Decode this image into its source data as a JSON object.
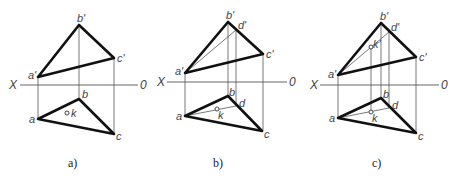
{
  "figure": {
    "axis_labels": {
      "left": "X",
      "right": "0"
    },
    "panels": [
      {
        "id": "a",
        "caption": "a)",
        "labels": {
          "a_top": "a'",
          "b_top": "b'",
          "c_top": "c'",
          "a_bot": "a",
          "b_bot": "b",
          "c_bot": "c",
          "k_bot": "k"
        }
      },
      {
        "id": "b",
        "caption": "b)",
        "labels": {
          "a_top": "a'",
          "b_top": "b'",
          "c_top": "c'",
          "d_top": "d'",
          "a_bot": "a",
          "b_bot": "b",
          "c_bot": "c",
          "d_bot": "d",
          "k_bot": "k"
        }
      },
      {
        "id": "c",
        "caption": "c)",
        "labels": {
          "a_top": "a'",
          "b_top": "b'",
          "c_top": "c'",
          "d_top": "d'",
          "k_top": "k'",
          "a_bot": "a",
          "b_bot": "b",
          "c_bot": "c",
          "d_bot": "d",
          "k_bot": "k"
        }
      }
    ]
  }
}
